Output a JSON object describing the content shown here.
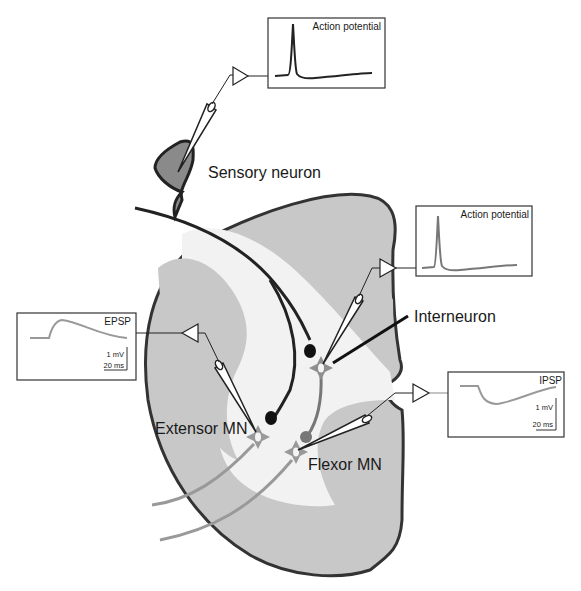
{
  "labels": {
    "sensory_neuron": "Sensory neuron",
    "interneuron": "Interneuron",
    "extensor_mn": "Extensor MN",
    "flexor_mn": "Flexor MN"
  },
  "recordings": {
    "sensory": {
      "title": "Action potential",
      "type": "action-potential"
    },
    "interneuron": {
      "title": "Action potential",
      "type": "action-potential"
    },
    "extensor": {
      "title": "EPSP",
      "scale_v": "1 mV",
      "scale_t": "20 ms",
      "type": "epsp"
    },
    "flexor": {
      "title": "IPSP",
      "scale_v": "1 mV",
      "scale_t": "20 ms",
      "type": "ipsp"
    }
  },
  "colors": {
    "gray_matter": "#c8c8c8",
    "white_tract": "#f2f2f2",
    "outline": "#333333",
    "sensory_soma": "#8a8a8a",
    "motor_neuron": "#999999",
    "trace_dark": "#222222",
    "trace_gray": "#8c8c8c"
  }
}
